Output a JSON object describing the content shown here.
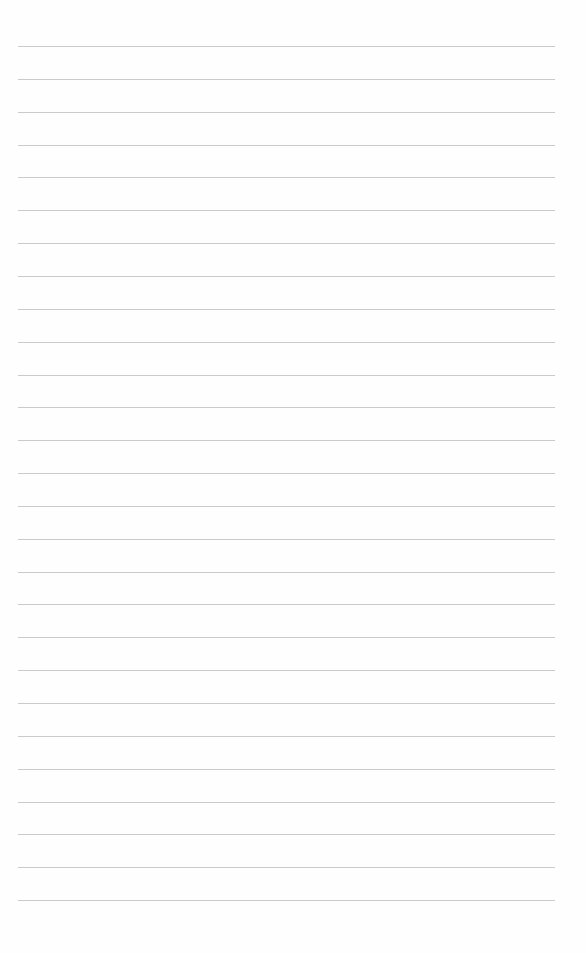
{
  "page": {
    "type": "lined-paper",
    "background_color": "#fefefe",
    "line_color": "#b8b8b8",
    "line_count": 27,
    "first_line_y": 46,
    "line_spacing": 32.85,
    "line_left": 18,
    "line_right": 555
  }
}
